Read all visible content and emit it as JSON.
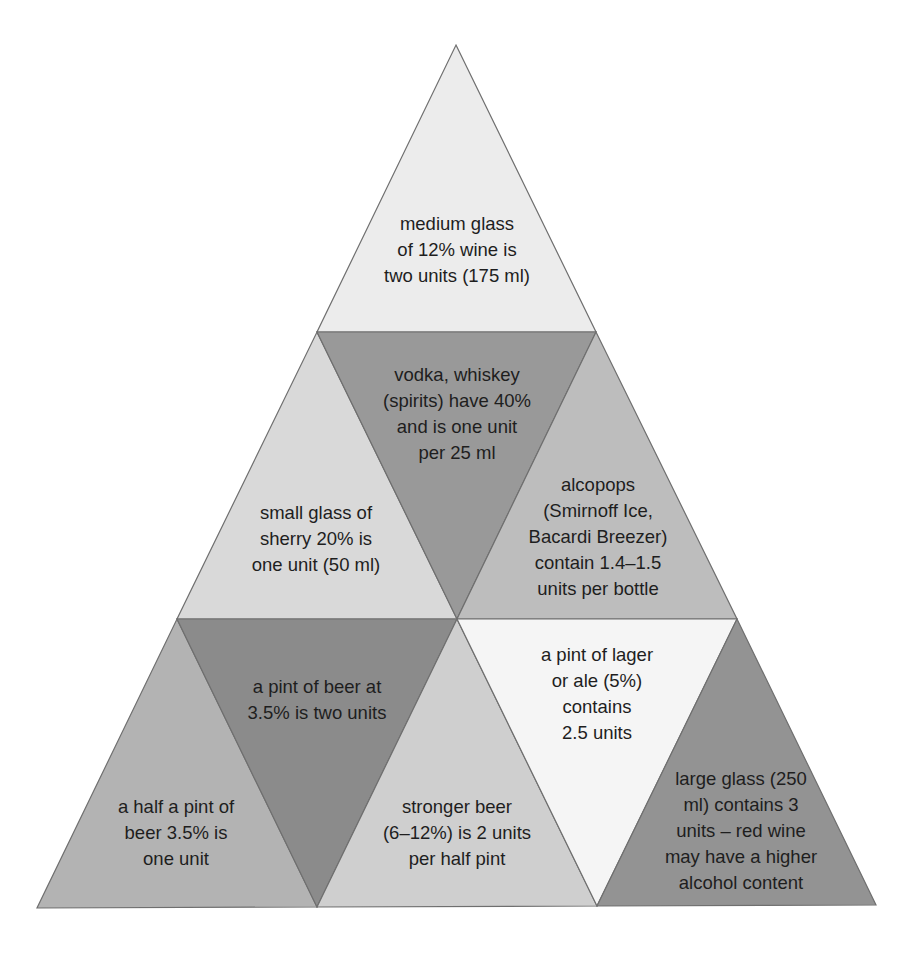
{
  "diagram": {
    "type": "pyramid of alcohol units",
    "cells": [
      {
        "id": "medium-glass-wine",
        "text": "medium glass\nof 12% wine is\ntwo units (175 ml)",
        "color": "#ececec"
      },
      {
        "id": "small-glass-sherry",
        "text": "small glass of\nsherry 20% is\none unit (50 ml)",
        "color": "#d9d9d9"
      },
      {
        "id": "spirits",
        "text": "vodka, whiskey\n(spirits) have 40%\nand is one unit\nper 25 ml",
        "color": "#999999"
      },
      {
        "id": "alcopops",
        "text": "alcopops\n(Smirnoff Ice,\nBacardi Breezer)\ncontain 1.4–1.5\nunits per bottle",
        "color": "#bdbdbd"
      },
      {
        "id": "half-pint-beer",
        "text": "a half a pint of\nbeer 3.5% is\none unit",
        "color": "#b3b3b3"
      },
      {
        "id": "pint-beer",
        "text": "a pint of beer at\n3.5% is two units",
        "color": "#8b8b8b"
      },
      {
        "id": "stronger-beer",
        "text": "stronger beer\n(6–12%) is 2 units\nper half pint",
        "color": "#cfcfcf"
      },
      {
        "id": "pint-lager",
        "text": "a pint of lager\nor ale (5%)\ncontains\n2.5 units",
        "color": "#f5f5f5"
      },
      {
        "id": "large-glass-wine",
        "text": "large glass (250\nml) contains 3\nunits – red wine\nmay have a higher\nalcohol content",
        "color": "#939393"
      }
    ]
  }
}
